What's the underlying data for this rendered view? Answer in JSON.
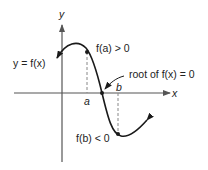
{
  "diagram": {
    "axes": {
      "x_label": "x",
      "y_label": "y"
    },
    "labels": {
      "curve": "y = f(x)",
      "fa": "f(a) > 0",
      "fb": "f(b) < 0",
      "root": "root of f(x) = 0",
      "a": "a",
      "b": "b"
    },
    "colors": {
      "axis": "#555555",
      "curve": "#1a1a1a",
      "dashed": "#888888",
      "text": "#222222"
    }
  }
}
